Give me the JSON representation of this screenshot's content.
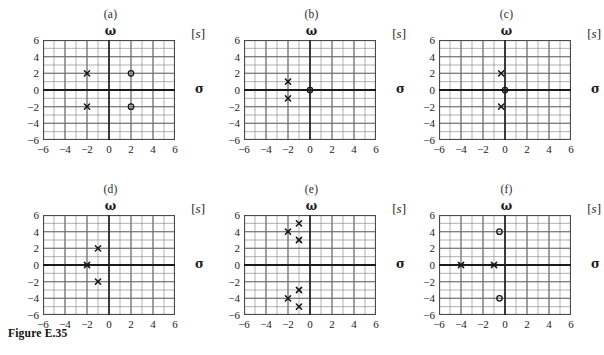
{
  "figure": {
    "caption": "Figure E.35",
    "axis_labels": {
      "imaginary": "ω",
      "real": "σ",
      "plane": "s",
      "plane_bracket_open": "[",
      "plane_bracket_close": "]"
    },
    "axis_ticks": {
      "x": [
        "-6",
        "-4",
        "-2",
        "0",
        "2",
        "4",
        "6"
      ],
      "y": [
        "6",
        "4",
        "2",
        "0",
        "-2",
        "-4",
        "-6"
      ]
    },
    "marker_names": {
      "pole": "pole-marker-x",
      "zero": "zero-marker-o"
    },
    "colors": {
      "grid_minor": "#8f8f94",
      "grid_major": "#6d6d72",
      "axis": "#1a1a1a",
      "frame": "#4a4a4f",
      "marker": "#141414",
      "background": "#ffffff"
    }
  },
  "chart_data": [
    {
      "type": "scatter",
      "title": "(a)",
      "xlabel": "σ",
      "ylabel": "ω",
      "xlim": [
        -6,
        6
      ],
      "ylim": [
        -6,
        6
      ],
      "xticks": [
        -6,
        -4,
        -2,
        0,
        2,
        4,
        6
      ],
      "yticks": [
        -6,
        -4,
        -2,
        0,
        2,
        4,
        6
      ],
      "grid": true,
      "legend": "none",
      "series": [
        {
          "name": "poles",
          "marker": "x",
          "points": [
            [
              -2,
              2
            ],
            [
              -2,
              -2
            ]
          ]
        },
        {
          "name": "zeros",
          "marker": "o",
          "points": [
            [
              2,
              2
            ],
            [
              2,
              -2
            ]
          ]
        }
      ]
    },
    {
      "type": "scatter",
      "title": "(b)",
      "xlabel": "σ",
      "ylabel": "ω",
      "xlim": [
        -6,
        6
      ],
      "ylim": [
        -6,
        6
      ],
      "xticks": [
        -6,
        -4,
        -2,
        0,
        2,
        4,
        6
      ],
      "yticks": [
        -6,
        -4,
        -2,
        0,
        2,
        4,
        6
      ],
      "grid": true,
      "legend": "none",
      "series": [
        {
          "name": "poles",
          "marker": "x",
          "points": [
            [
              -2,
              1
            ],
            [
              -2,
              -1
            ]
          ]
        },
        {
          "name": "zeros",
          "marker": "o",
          "points": [
            [
              0,
              0
            ]
          ]
        }
      ]
    },
    {
      "type": "scatter",
      "title": "(c)",
      "xlabel": "σ",
      "ylabel": "ω",
      "xlim": [
        -6,
        6
      ],
      "ylim": [
        -6,
        6
      ],
      "xticks": [
        -6,
        -4,
        -2,
        0,
        2,
        4,
        6
      ],
      "yticks": [
        -6,
        -4,
        -2,
        0,
        2,
        4,
        6
      ],
      "grid": true,
      "legend": "none",
      "series": [
        {
          "name": "poles",
          "marker": "x",
          "points": [
            [
              -0.35,
              2
            ],
            [
              -0.35,
              -2
            ]
          ]
        },
        {
          "name": "zeros",
          "marker": "o",
          "points": [
            [
              0,
              0
            ]
          ]
        }
      ]
    },
    {
      "type": "scatter",
      "title": "(d)",
      "xlabel": "σ",
      "ylabel": "ω",
      "xlim": [
        -6,
        6
      ],
      "ylim": [
        -6,
        6
      ],
      "xticks": [
        -6,
        -4,
        -2,
        0,
        2,
        4,
        6
      ],
      "yticks": [
        -6,
        -4,
        -2,
        0,
        2,
        4,
        6
      ],
      "grid": true,
      "legend": "none",
      "series": [
        {
          "name": "poles",
          "marker": "x",
          "points": [
            [
              -1,
              2
            ],
            [
              -2,
              0
            ],
            [
              -1,
              -2
            ]
          ]
        },
        {
          "name": "zeros",
          "marker": "o",
          "points": []
        }
      ]
    },
    {
      "type": "scatter",
      "title": "(e)",
      "xlabel": "σ",
      "ylabel": "ω",
      "xlim": [
        -6,
        6
      ],
      "ylim": [
        -6,
        6
      ],
      "xticks": [
        -6,
        -4,
        -2,
        0,
        2,
        4,
        6
      ],
      "yticks": [
        -6,
        -4,
        -2,
        0,
        2,
        4,
        6
      ],
      "grid": true,
      "legend": "none",
      "series": [
        {
          "name": "poles",
          "marker": "x",
          "points": [
            [
              -1,
              5
            ],
            [
              -2,
              4
            ],
            [
              -1,
              3
            ],
            [
              -1,
              -3
            ],
            [
              -2,
              -4
            ],
            [
              -1,
              -5
            ]
          ]
        },
        {
          "name": "zeros",
          "marker": "o",
          "points": []
        }
      ]
    },
    {
      "type": "scatter",
      "title": "(f)",
      "xlabel": "σ",
      "ylabel": "ω",
      "xlim": [
        -6,
        6
      ],
      "ylim": [
        -6,
        6
      ],
      "xticks": [
        -6,
        -4,
        -2,
        0,
        2,
        4,
        6
      ],
      "yticks": [
        -6,
        -4,
        -2,
        0,
        2,
        4,
        6
      ],
      "grid": true,
      "legend": "none",
      "series": [
        {
          "name": "poles",
          "marker": "x",
          "points": [
            [
              -4,
              0
            ],
            [
              -1,
              0
            ]
          ]
        },
        {
          "name": "zeros",
          "marker": "o",
          "points": [
            [
              -0.5,
              4
            ],
            [
              -0.5,
              -4
            ]
          ]
        }
      ]
    }
  ]
}
